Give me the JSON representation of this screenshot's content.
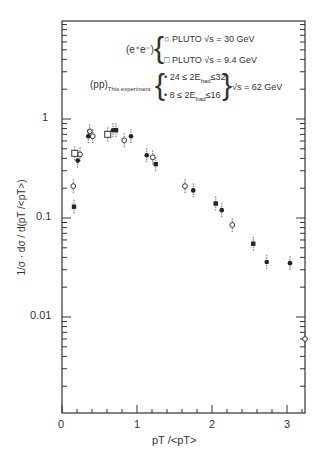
{
  "chart_data": {
    "type": "scatter",
    "title": "",
    "xlabel": "p_T / <p_T>",
    "ylabel": "1/σ · dσ / d(p_T/<p_T>)",
    "xlim": [
      0,
      3.2
    ],
    "ylim": [
      0.001,
      2.5
    ],
    "yscale": "log",
    "x_ticks": [
      "0",
      "1",
      "2",
      "3"
    ],
    "y_ticks": [
      "1",
      "0.1",
      "0.01"
    ],
    "grid": false,
    "legend": {
      "position": "upper right",
      "groups": [
        {
          "label": "(e+e-)",
          "entries": [
            {
              "marker": "open-circle",
              "text": "PLUTO √s = 30 GeV"
            },
            {
              "marker": "open-square",
              "text": "PLUTO √s = 9.4 GeV"
            }
          ]
        },
        {
          "label": "(pp) This experiment",
          "suffix": "√s = 62 GeV",
          "entries": [
            {
              "marker": "filled-circle",
              "text": "24 ≤ 2E_had ≤ 32"
            },
            {
              "marker": "filled-square",
              "text": "8 ≤ 2E_had ≤ 16"
            }
          ]
        }
      ]
    },
    "series": [
      {
        "name": "PLUTO √s = 30 GeV",
        "marker": "open-circle",
        "x": [
          0.15,
          0.24,
          0.37,
          0.41,
          0.83,
          1.21,
          1.64,
          2.27,
          3.24
        ],
        "y": [
          0.21,
          0.44,
          0.75,
          0.67,
          0.61,
          0.41,
          0.21,
          0.085,
          0.006
        ]
      },
      {
        "name": "PLUTO √s = 9.4 GeV",
        "marker": "open-square",
        "x": [
          0.17,
          0.61
        ],
        "y": [
          0.45,
          0.7
        ]
      },
      {
        "name": "24 ≤ 2E_had ≤ 32",
        "marker": "filled-circle",
        "x": [
          0.21,
          0.35,
          0.68,
          0.92,
          1.13,
          1.75,
          2.13,
          2.73,
          3.04
        ],
        "y": [
          0.38,
          0.67,
          0.77,
          0.67,
          0.43,
          0.19,
          0.12,
          0.036,
          0.035
        ]
      },
      {
        "name": "8 ≤ 2E_had ≤ 16",
        "marker": "filled-square",
        "x": [
          0.16,
          0.72,
          1.25,
          2.05,
          2.55
        ],
        "y": [
          0.13,
          0.77,
          0.35,
          0.14,
          0.055
        ]
      }
    ]
  },
  "labels": {
    "ylabel": "1/σ · dσ / d(pT /<pT>)",
    "xlabel": "pT  /<pT>",
    "tick_x": [
      "0",
      "1",
      "2",
      "3"
    ],
    "tick_y": [
      "1",
      "0.1",
      "0.01"
    ],
    "legend_ee": "(e⁺e⁻)",
    "legend_pluto30": "○ PLUTO √s = 30 GeV",
    "legend_pluto94": "□ PLUTO √s = 9.4 GeV",
    "legend_pp": "(pp)",
    "legend_pp_sub": "This experiment",
    "legend_hi": "• 24 ≤ 2E",
    "legend_hi_sub": "had",
    "legend_hi_end": "≤32",
    "legend_lo": "• 8 ≤ 2E",
    "legend_lo_sub": "had",
    "legend_lo_end": "≤16",
    "legend_energy": "√s = 62 GeV"
  }
}
